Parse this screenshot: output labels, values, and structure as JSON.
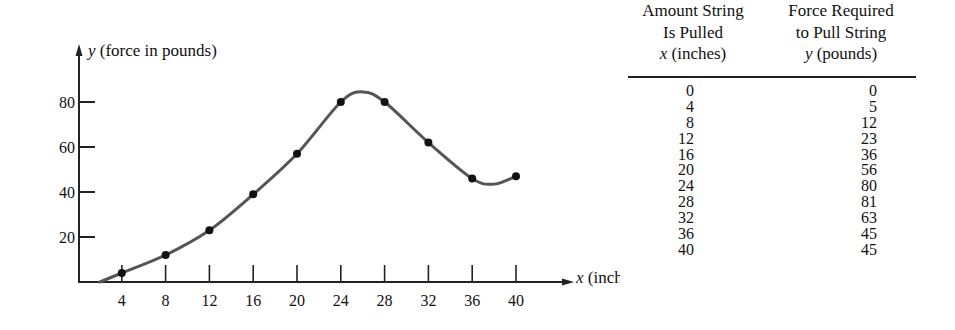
{
  "chart_data": {
    "type": "line",
    "title": "",
    "xlabel": "x (inches)",
    "ylabel": "y (force in pounds)",
    "x": [
      0,
      4,
      8,
      12,
      16,
      20,
      24,
      28,
      32,
      36,
      40
    ],
    "series": [
      {
        "name": "Force required to pull string",
        "values": [
          0,
          5,
          12,
          23,
          36,
          56,
          80,
          81,
          63,
          45,
          45
        ]
      }
    ],
    "plotted_points_x": [
      4,
      8,
      12,
      16,
      20,
      24,
      28,
      32,
      36,
      40
    ],
    "plotted_points_y": [
      4,
      12,
      23,
      39,
      57,
      80,
      80,
      62,
      46,
      47
    ],
    "xticks": [
      "4",
      "8",
      "12",
      "16",
      "20",
      "24",
      "28",
      "32",
      "36",
      "40"
    ],
    "yticks": [
      "20",
      "40",
      "60",
      "80"
    ],
    "xlim": [
      0,
      45
    ],
    "ylim": [
      0,
      90
    ],
    "grid": false,
    "legend": "none",
    "curve": "smooth curve through data points"
  },
  "axes": {
    "y_label_var": "y",
    "y_label_text": " (force in pounds)",
    "x_label_var": "x",
    "x_label_text": " (inches)"
  },
  "table": {
    "col1_header": [
      "Amount String",
      "Is Pulled"
    ],
    "col1_var": "x",
    "col1_unit": " (inches)",
    "col2_header": [
      "Force Required",
      "to Pull String"
    ],
    "col2_var": "y",
    "col2_unit": " (pounds)",
    "rows": [
      {
        "x": "0",
        "y": "0"
      },
      {
        "x": "4",
        "y": "5"
      },
      {
        "x": "8",
        "y": "12"
      },
      {
        "x": "12",
        "y": "23"
      },
      {
        "x": "16",
        "y": "36"
      },
      {
        "x": "20",
        "y": "56"
      },
      {
        "x": "24",
        "y": "80"
      },
      {
        "x": "28",
        "y": "81"
      },
      {
        "x": "32",
        "y": "63"
      },
      {
        "x": "36",
        "y": "45"
      },
      {
        "x": "40",
        "y": "45"
      }
    ]
  },
  "colors": {
    "curve": "#555555",
    "points": "#111111",
    "axes": "#222222"
  }
}
